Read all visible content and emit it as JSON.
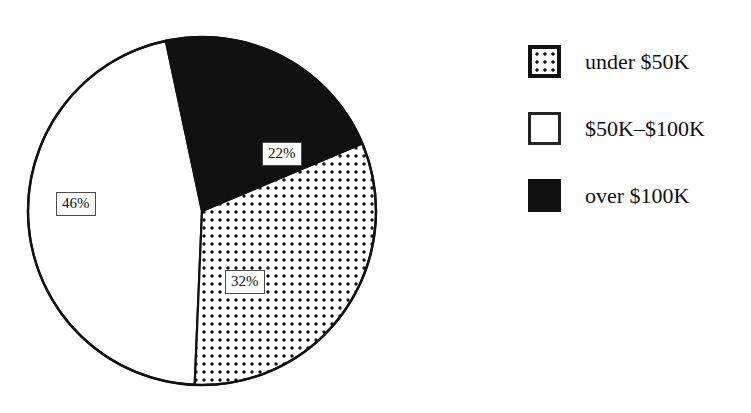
{
  "chart_data": {
    "type": "pie",
    "title": "",
    "subtitle": "",
    "xlabel": "",
    "ylabel": "",
    "grid": false,
    "legend_position": "right",
    "categories": [
      "under $50K",
      "$50K–$100K",
      "over $100K"
    ],
    "values": [
      32,
      46,
      22
    ],
    "value_labels": [
      "32%",
      "46%",
      "22%"
    ],
    "slices": [
      {
        "label": "under $50K",
        "value": 32,
        "value_label": "32%",
        "fill": "dotted",
        "start_angle_deg": 67.2,
        "end_angle_deg": 182.4,
        "color": "#ffffff",
        "dot_color": "#111111"
      },
      {
        "label": "$50K–$100K",
        "value": 46,
        "value_label": "46%",
        "fill": "solid-white",
        "start_angle_deg": 182.4,
        "end_angle_deg": 348.0,
        "color": "#ffffff"
      },
      {
        "label": "over $100K",
        "value": 22,
        "value_label": "22%",
        "fill": "solid-black",
        "start_angle_deg": 348.0,
        "end_angle_deg": 67.2,
        "color": "#111111"
      }
    ],
    "geometry": {
      "center_x": 202,
      "center_y": 211,
      "radius": 174
    },
    "outline_color": "#111111"
  },
  "legend": {
    "items": [
      {
        "label": "under $50K",
        "swatch": "dotted-swatch"
      },
      {
        "label": "$50K–$100K",
        "swatch": "white-swatch"
      },
      {
        "label": "over $100K",
        "swatch": "black-swatch"
      }
    ]
  },
  "pie_labels": {
    "over_100k": "22%",
    "under_50k": "32%",
    "mid_range": "46%"
  }
}
